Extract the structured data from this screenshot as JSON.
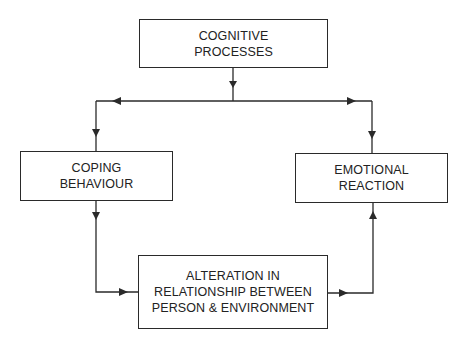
{
  "diagram": {
    "nodes": {
      "cognitive": {
        "lines": [
          "COGNITIVE",
          "PROCESSES"
        ]
      },
      "coping": {
        "lines": [
          "COPING",
          "BEHAVIOUR"
        ]
      },
      "emotional": {
        "lines": [
          "EMOTIONAL",
          "REACTION"
        ]
      },
      "alteration": {
        "lines": [
          "ALTERATION IN",
          "RELATIONSHIP BETWEEN",
          "PERSON & ENVIRONMENT"
        ]
      }
    },
    "edges": [
      {
        "from": "cognitive",
        "to": "coping"
      },
      {
        "from": "cognitive",
        "to": "emotional"
      },
      {
        "from": "coping",
        "to": "alteration"
      },
      {
        "from": "alteration",
        "to": "emotional"
      }
    ],
    "colors": {
      "line": "#2a2a2a",
      "text": "#222222",
      "background": "#ffffff"
    }
  }
}
